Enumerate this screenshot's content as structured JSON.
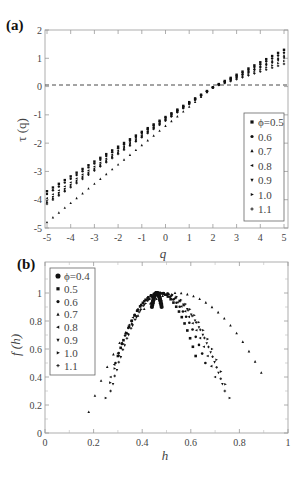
{
  "figure": {
    "panel_a_label": "(a)",
    "panel_b_label": "(b)"
  },
  "chart_data": [
    {
      "panel": "(a)",
      "type": "scatter",
      "title": "",
      "xlabel": "q",
      "ylabel": "τ (q)",
      "xlim": [
        -5,
        5
      ],
      "ylim": [
        -5,
        2
      ],
      "xticks": [
        -5,
        -4,
        -3,
        -2,
        -1,
        0,
        1,
        2,
        3,
        4,
        5
      ],
      "yticks": [
        -5,
        -4,
        -3,
        -2,
        -1,
        0,
        1,
        2
      ],
      "reference_line": {
        "y": 0,
        "style": "dashed"
      },
      "legend": {
        "position": "lower right",
        "entries": [
          "ϕ=0.5",
          "0.6",
          "0.7",
          "0.8",
          "0.9",
          "1.0",
          "1.1"
        ]
      },
      "markers": [
        "square",
        "circle",
        "triangle-up",
        "triangle-left",
        "triangle-down",
        "triangle-right",
        "plus"
      ],
      "x_step": 0.25,
      "series": [
        {
          "name": "ϕ=0.5",
          "q0": 2.05,
          "slope_neg": 0.63,
          "slope_pos": 0.42,
          "tau_at_minus5": -3.7,
          "tau_at_5": 1.3
        },
        {
          "name": "0.6",
          "q0": 2.05,
          "slope_neg": 0.64,
          "slope_pos": 0.4,
          "tau_at_minus5": -3.8,
          "tau_at_5": 1.2
        },
        {
          "name": "0.7",
          "q0": 2.05,
          "slope_neg": 0.69,
          "slope_pos": 0.37,
          "tau_at_minus5": -4.8,
          "tau_at_5": 1.1
        },
        {
          "name": "0.8",
          "q0": 2.05,
          "slope_neg": 0.65,
          "slope_pos": 0.36,
          "tau_at_minus5": -3.95,
          "tau_at_5": 1.05
        },
        {
          "name": "0.9",
          "q0": 2.05,
          "slope_neg": 0.66,
          "slope_pos": 0.34,
          "tau_at_minus5": -4.05,
          "tau_at_5": 1.0
        },
        {
          "name": "1.0",
          "q0": 2.05,
          "slope_neg": 0.66,
          "slope_pos": 0.3,
          "tau_at_minus5": -4.1,
          "tau_at_5": 0.9
        },
        {
          "name": "1.1",
          "q0": 2.05,
          "slope_neg": 0.67,
          "slope_pos": 0.27,
          "tau_at_minus5": -4.15,
          "tau_at_5": 0.8
        }
      ]
    },
    {
      "panel": "(b)",
      "type": "scatter",
      "title": "",
      "xlabel": "h",
      "ylabel": "f (h)",
      "xlim": [
        0,
        1
      ],
      "ylim": [
        0,
        1.2
      ],
      "xticks": [
        0,
        0.2,
        0.4,
        0.6,
        0.8,
        1
      ],
      "yticks": [
        0,
        0.2,
        0.4,
        0.6,
        0.8,
        1
      ],
      "legend": {
        "position": "upper left",
        "entries": [
          "ϕ=0.4",
          "0.5",
          "0.6",
          "0.7",
          "0.8",
          "0.9",
          "1.0",
          "1.1"
        ]
      },
      "markers": [
        "circle-large",
        "square",
        "circle",
        "triangle-up",
        "triangle-left",
        "triangle-down",
        "triangle-right",
        "plus"
      ],
      "series": [
        {
          "name": "ϕ=0.4",
          "h_min": 0.44,
          "h_peak": 0.46,
          "h_max": 0.48,
          "f_min": 0.9
        },
        {
          "name": "0.5",
          "h_min": 0.3,
          "h_peak": 0.47,
          "h_max": 0.62,
          "f_min": 0.55
        },
        {
          "name": "0.6",
          "h_min": 0.29,
          "h_peak": 0.47,
          "h_max": 0.66,
          "f_min": 0.5
        },
        {
          "name": "0.7",
          "h_min": 0.18,
          "h_peak": 0.54,
          "h_max": 0.89,
          "f_min": 0.15,
          "f_at_hmax": 0.43
        },
        {
          "name": "0.8",
          "h_min": 0.27,
          "h_peak": 0.47,
          "h_max": 0.7,
          "f_min": 0.4
        },
        {
          "name": "0.9",
          "h_min": 0.28,
          "h_peak": 0.48,
          "h_max": 0.73,
          "f_min": 0.35
        },
        {
          "name": "1.0",
          "h_min": 0.25,
          "h_peak": 0.49,
          "h_max": 0.76,
          "f_min": 0.25
        },
        {
          "name": "1.1",
          "h_min": 0.27,
          "h_peak": 0.48,
          "h_max": 0.74,
          "f_min": 0.3
        }
      ]
    }
  ]
}
